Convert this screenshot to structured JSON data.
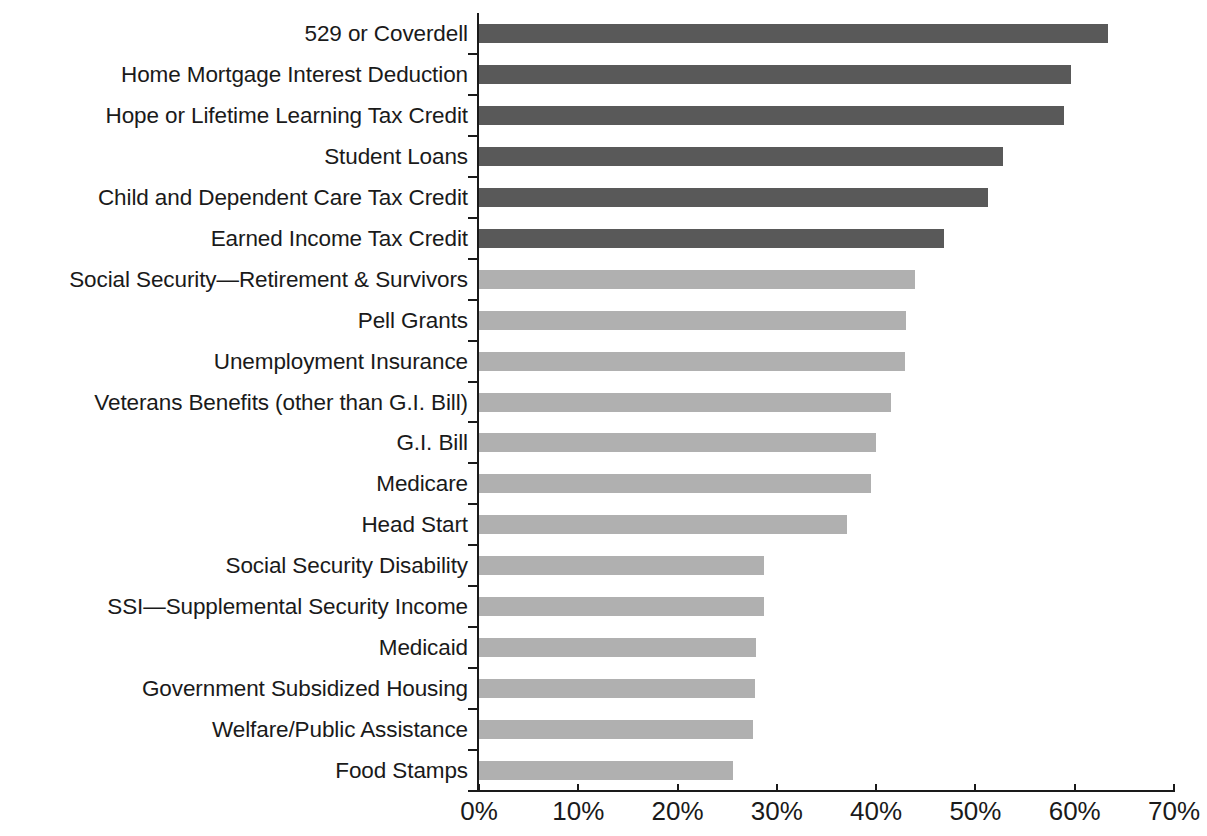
{
  "chart_data": {
    "type": "bar",
    "orientation": "horizontal",
    "title": "",
    "subtitle": "",
    "xlabel": "",
    "ylabel": "",
    "xlim": [
      0,
      70
    ],
    "xtick_labels": [
      "0%",
      "10%",
      "20%",
      "30%",
      "40%",
      "50%",
      "60%",
      "70%"
    ],
    "xtick_values": [
      0,
      10,
      20,
      30,
      40,
      50,
      60,
      70
    ],
    "grid": false,
    "legend": "none",
    "value_unit": "%",
    "categories": [
      "529 or Coverdell",
      "Home Mortgage Interest Deduction",
      "Hope or Lifetime Learning Tax Credit",
      "Student Loans",
      "Child and Dependent Care Tax Credit",
      "Earned Income Tax Credit",
      "Social Security—Retirement & Survivors",
      "Pell Grants",
      "Unemployment Insurance",
      "Veterans Benefits (other than G.I. Bill)",
      "G.I. Bill",
      "Medicare",
      "Head Start",
      "Social Security Disability",
      "SSI—Supplemental Security Income",
      "Medicaid",
      "Government Subsidized Housing",
      "Welfare/Public Assistance",
      "Food Stamps"
    ],
    "values": [
      63.4,
      59.6,
      58.9,
      52.8,
      51.3,
      46.8,
      43.9,
      43.0,
      42.9,
      41.5,
      40.0,
      39.5,
      37.1,
      28.7,
      28.7,
      27.9,
      27.8,
      27.6,
      25.6
    ],
    "bar_groups": [
      "dark",
      "dark",
      "dark",
      "dark",
      "dark",
      "dark",
      "light",
      "light",
      "light",
      "light",
      "light",
      "light",
      "light",
      "light",
      "light",
      "light",
      "light",
      "light",
      "light"
    ],
    "colors": {
      "dark_bar": "#595959",
      "light_bar": "#b0b0b0",
      "axis": "#1a1a1a",
      "text": "#1a1a1a",
      "background": "#ffffff"
    }
  }
}
